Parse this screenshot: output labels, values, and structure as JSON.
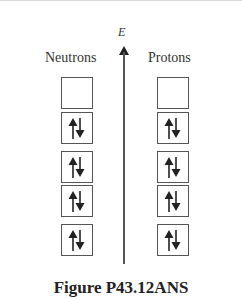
{
  "diagram": {
    "axis_label": "E",
    "columns": [
      {
        "label": "Neutrons",
        "levels": [
          "empty",
          "paired",
          "paired",
          "paired",
          "paired"
        ]
      },
      {
        "label": "Protons",
        "levels": [
          "empty",
          "paired",
          "paired",
          "paired",
          "paired"
        ]
      }
    ],
    "spin_icons": {
      "up": "up-arrow",
      "down": "down-arrow"
    },
    "caption": "Figure P43.12ANS"
  }
}
